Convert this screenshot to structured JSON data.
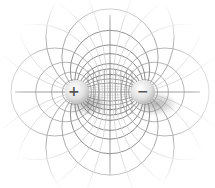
{
  "diagram": {
    "charges": [
      {
        "id": "positive",
        "sign": "+",
        "label": "+",
        "x": 77,
        "y": 92,
        "r": 12
      },
      {
        "id": "negative",
        "sign": "-",
        "label": "−",
        "x": 143,
        "y": 92,
        "r": 12
      }
    ],
    "colors": {
      "background": "#ffffff",
      "field_line": "#6e6e6e",
      "equipotential": "#8a8a8a",
      "faint_line": "#c8c8c8",
      "charge_fill": "#e6e6e6",
      "charge_shadow": "#9a9a9a"
    }
  }
}
